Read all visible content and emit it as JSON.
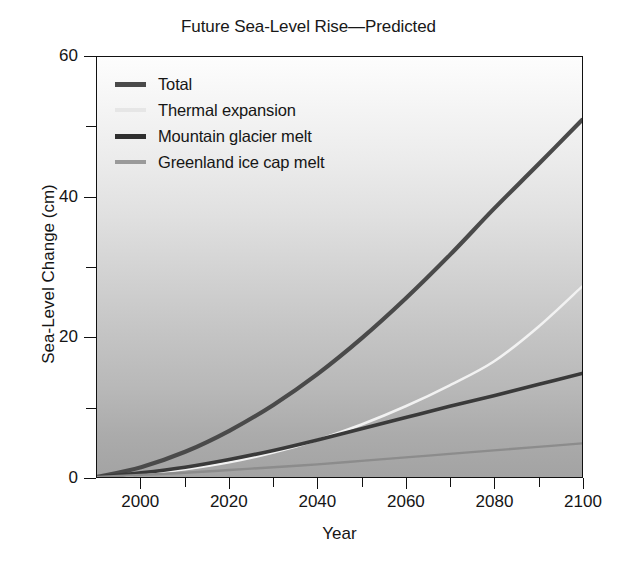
{
  "chart_data": {
    "type": "line",
    "title": "Future Sea-Level Rise—Predicted",
    "xlabel": "Year",
    "ylabel": "Sea-Level Change (cm)",
    "xlim": [
      1990,
      2100
    ],
    "ylim": [
      0,
      60
    ],
    "grid": false,
    "legend_position": "top-left",
    "x_major_ticks": [
      2000,
      2020,
      2040,
      2060,
      2080,
      2100
    ],
    "x_minor_ticks": [
      2010,
      2030,
      2050,
      2070,
      2090
    ],
    "x_tick_labels": [
      "2000",
      "2020",
      "2040",
      "2060",
      "2080",
      "2100"
    ],
    "y_major_ticks": [
      0,
      20,
      40,
      60
    ],
    "y_minor_ticks": [
      10,
      30,
      50
    ],
    "y_tick_labels": [
      "0",
      "20",
      "40",
      "60"
    ],
    "x": [
      1990,
      2000,
      2010,
      2020,
      2030,
      2040,
      2050,
      2060,
      2070,
      2080,
      2090,
      2100
    ],
    "series": [
      {
        "name": "Total",
        "color": "#4a4a4a",
        "width": 4.2,
        "values": [
          0.0,
          1.4,
          3.6,
          6.6,
          10.3,
          14.7,
          19.8,
          25.5,
          31.7,
          38.3,
          44.6,
          51.0
        ]
      },
      {
        "name": "Thermal expansion",
        "color": "#f2f2f2",
        "width": 2.6,
        "values": [
          0.0,
          0.4,
          1.1,
          2.1,
          3.5,
          5.3,
          7.5,
          10.1,
          13.1,
          16.5,
          21.4,
          27.2
        ]
      },
      {
        "name": "Mountain glacier melt",
        "color": "#3a3a3a",
        "width": 3.6,
        "values": [
          0.0,
          0.6,
          1.4,
          2.5,
          3.8,
          5.3,
          6.9,
          8.5,
          10.1,
          11.6,
          13.2,
          14.8
        ]
      },
      {
        "name": "Greenland ice cap melt",
        "color": "#8c8c8c",
        "width": 2.4,
        "values": [
          0.0,
          0.3,
          0.6,
          1.0,
          1.4,
          1.8,
          2.3,
          2.8,
          3.3,
          3.8,
          4.3,
          4.8
        ]
      }
    ]
  },
  "legend": {
    "items": [
      {
        "label": "Total",
        "color": "#4a4a4a",
        "thickness": "5px"
      },
      {
        "label": "Thermal expansion",
        "color": "#e6e6e6",
        "thickness": "4px"
      },
      {
        "label": "Mountain glacier melt",
        "color": "#2f2f2f",
        "thickness": "5px"
      },
      {
        "label": "Greenland ice cap melt",
        "color": "#9a9a9a",
        "thickness": "4px"
      }
    ]
  }
}
